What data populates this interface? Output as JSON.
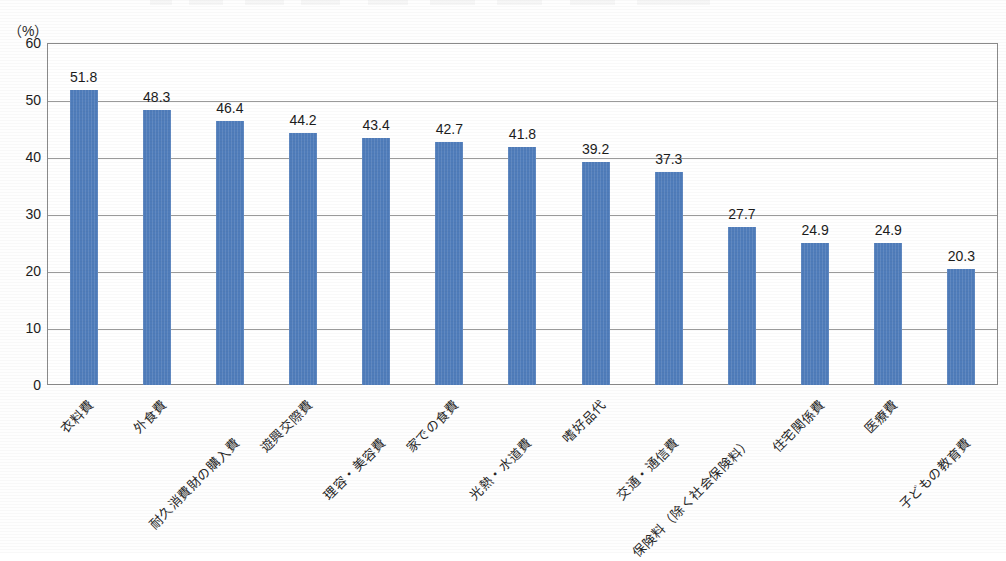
{
  "chart_data": {
    "type": "bar",
    "title": "",
    "xlabel": "",
    "ylabel": "",
    "unit_label": "（%）",
    "ylim": [
      0,
      60
    ],
    "ystep": 10,
    "grid": true,
    "legend": "none",
    "bar_color": "#4f7cba",
    "axis_color": "#8a8a8a",
    "yticks": [
      "60",
      "50",
      "40",
      "30",
      "20",
      "10",
      "0"
    ],
    "categories": [
      "衣料費",
      "外食費",
      "耐久消費財の購入費",
      "遊興交際費",
      "理容・美容費",
      "家での食費",
      "光熱・水道費",
      "嗜好品代",
      "交通・通信費",
      "保険料（除く社会保険料）",
      "住宅関係費",
      "医療費",
      "子どもの教育費"
    ],
    "values": [
      51.8,
      48.3,
      46.4,
      44.2,
      43.4,
      42.7,
      41.8,
      39.2,
      37.3,
      27.7,
      24.9,
      24.9,
      20.3
    ],
    "value_labels": [
      "51.8",
      "48.3",
      "46.4",
      "44.2",
      "43.4",
      "42.7",
      "41.8",
      "39.2",
      "37.3",
      "27.7",
      "24.9",
      "24.9",
      "20.3"
    ],
    "label_rows": [
      0,
      0,
      1,
      0,
      1,
      0,
      1,
      0,
      1,
      1,
      0,
      0,
      1
    ]
  }
}
